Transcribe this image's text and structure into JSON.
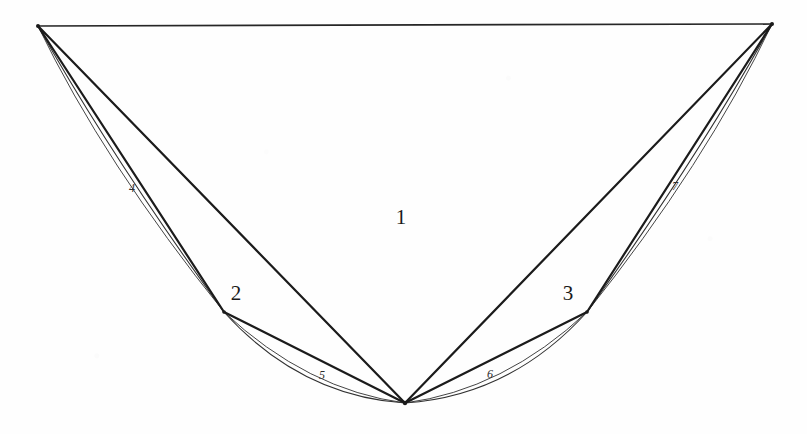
{
  "figure": {
    "background_color": "#fefefe",
    "ink_color": "#1b1b1b",
    "width": 807,
    "height": 434,
    "vertices": [
      {
        "id": "A",
        "name": "top-left-vertex",
        "x": 38,
        "y": 26
      },
      {
        "id": "B",
        "name": "top-right-vertex",
        "x": 772,
        "y": 24
      },
      {
        "id": "C",
        "name": "bottom-vertex",
        "x": 405,
        "y": 403
      },
      {
        "id": "D",
        "name": "left-mid-vertex",
        "x": 224,
        "y": 312
      },
      {
        "id": "E",
        "name": "right-mid-vertex",
        "x": 587,
        "y": 312
      }
    ],
    "straight_edges": [
      {
        "name": "edge-top",
        "from": "A",
        "to": "B",
        "d": "M 38 26 L 772 24"
      },
      {
        "name": "edge-A-to-C",
        "from": "A",
        "to": "C",
        "d": "M 38 26 L 405 403"
      },
      {
        "name": "edge-B-to-C",
        "from": "B",
        "to": "C",
        "d": "M 772 24 L 405 403"
      },
      {
        "name": "edge-A-to-D",
        "from": "A",
        "to": "D",
        "d": "M 38 26 L 224 312"
      },
      {
        "name": "edge-D-to-C",
        "from": "D",
        "to": "C",
        "d": "M 224 312 L 405 403"
      },
      {
        "name": "edge-B-to-E",
        "from": "B",
        "to": "E",
        "d": "M 772 24 L 587 312"
      },
      {
        "name": "edge-E-to-C",
        "from": "E",
        "to": "C",
        "d": "M 587 312 L 405 403"
      }
    ],
    "arcs": [
      {
        "name": "arc-A-D-outer",
        "region": "4",
        "d": "M 38 26 Q 112 158 224 312"
      },
      {
        "name": "arc-A-D-inner",
        "region": "4",
        "d": "M 38 26 Q 104 163 224 312"
      },
      {
        "name": "arc-D-C-outer",
        "region": "5",
        "d": "M 224 312 Q 300 396 405 403"
      },
      {
        "name": "arc-D-C-inner",
        "region": "5",
        "d": "M 224 312 Q 307 390 405 403"
      },
      {
        "name": "arc-E-C-outer",
        "region": "6",
        "d": "M 587 312 Q 511 396 405 403"
      },
      {
        "name": "arc-E-C-inner",
        "region": "6",
        "d": "M 587 312 Q 504 390 405 403"
      },
      {
        "name": "arc-B-E-outer",
        "region": "7",
        "d": "M 772 24 Q 698 158 587 312"
      },
      {
        "name": "arc-B-E-inner",
        "region": "7",
        "d": "M 772 24 Q 706 163 587 312"
      }
    ],
    "labels": [
      {
        "id": "label-1",
        "text": "1",
        "x": 401,
        "y": 217,
        "size": "big",
        "describes": "central-region"
      },
      {
        "id": "label-2",
        "text": "2",
        "x": 236,
        "y": 293,
        "size": "big",
        "describes": "left-mid-vertex"
      },
      {
        "id": "label-3",
        "text": "3",
        "x": 568,
        "y": 293,
        "size": "big",
        "describes": "right-mid-vertex"
      },
      {
        "id": "label-4",
        "text": "4",
        "x": 132,
        "y": 188,
        "size": "small",
        "describes": "left-upper-lens"
      },
      {
        "id": "label-5",
        "text": "5",
        "x": 322,
        "y": 375,
        "size": "small",
        "describes": "left-lower-lens"
      },
      {
        "id": "label-6",
        "text": "6",
        "x": 490,
        "y": 374,
        "size": "small",
        "describes": "right-lower-lens"
      },
      {
        "id": "label-7",
        "text": "7",
        "x": 675,
        "y": 186,
        "size": "small",
        "describes": "right-upper-lens"
      }
    ]
  }
}
